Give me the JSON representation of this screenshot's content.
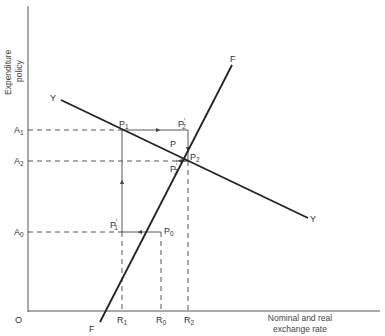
{
  "diagram": {
    "axes": {
      "origin_label": "O",
      "y_axis_title_line1": "Expenditure",
      "y_axis_title_line2": "policy",
      "x_axis_title_line1": "Nominal and real",
      "x_axis_title_line2": "exchange rate"
    },
    "y_ticks": [
      {
        "base": "A",
        "sub": "1"
      },
      {
        "base": "A",
        "sub": "2"
      },
      {
        "base": "A",
        "sub": "0"
      }
    ],
    "x_ticks": [
      {
        "base": "R",
        "sub": "1"
      },
      {
        "base": "R",
        "sub": "0"
      },
      {
        "base": "R",
        "sub": "2"
      }
    ],
    "curves": {
      "yy": {
        "start_label": "Y",
        "end_label": "Y"
      },
      "ff": {
        "start_label": "F",
        "end_label": "F"
      }
    },
    "points": {
      "p": {
        "base": "P",
        "sub": ""
      },
      "p0": {
        "base": "P",
        "sub": "0"
      },
      "p1": {
        "base": "P",
        "sub": "1"
      },
      "p2": {
        "base": "P",
        "sub": "2"
      },
      "p1_prime": {
        "base": "P",
        "sub": "1",
        "prime": "′"
      },
      "p2_prime": {
        "base": "P",
        "sub": "2",
        "prime": "′"
      },
      "p3_prime": {
        "base": "P",
        "sub": "3",
        "prime": "′"
      }
    },
    "colors": {
      "line": "#222222",
      "guide": "#444444"
    }
  }
}
